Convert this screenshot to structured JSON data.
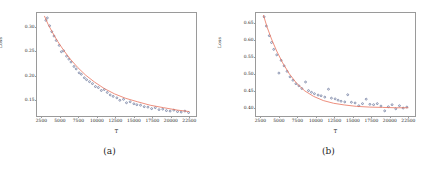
{
  "figure": {
    "width": 439,
    "height": 172,
    "background": "#ffffff"
  },
  "panels": [
    {
      "caption": "(a)",
      "chart_data": {
        "type": "scatter",
        "title": "",
        "xlabel": "T",
        "ylabel": "Loss",
        "xlim": [
          1900,
          23400
        ],
        "ylim": [
          0.118,
          0.328
        ],
        "xticks": [
          2500,
          5000,
          7500,
          10000,
          12500,
          15000,
          17500,
          20000,
          22500
        ],
        "xticklabels": [
          "2500",
          "5000",
          "7500",
          "10000",
          "12500",
          "15000",
          "17500",
          "20000",
          "22500"
        ],
        "yticks": [
          0.15,
          0.2,
          0.25,
          0.3
        ],
        "yticklabels": [
          "0.15",
          "0.20",
          "0.25",
          "0.30"
        ],
        "grid": false,
        "legend": null,
        "point_color": "#4a5a86",
        "line_color": "#e8705a",
        "series": [
          {
            "name": "observed loss",
            "type": "scatter",
            "x": [
              3100,
              3300,
              3600,
              3900,
              4200,
              4500,
              4900,
              5200,
              5500,
              5900,
              6200,
              6500,
              6900,
              7200,
              7600,
              7900,
              8300,
              8600,
              9000,
              9400,
              9800,
              10200,
              10600,
              11000,
              11400,
              11800,
              12200,
              12700,
              13100,
              13600,
              14000,
              14500,
              15000,
              15400,
              15900,
              16400,
              16900,
              17400,
              17900,
              18400,
              18900,
              19400,
              19900,
              20400,
              20900,
              21400,
              21900,
              22400
            ],
            "y": [
              0.313,
              0.318,
              0.302,
              0.29,
              0.281,
              0.272,
              0.262,
              0.249,
              0.251,
              0.24,
              0.234,
              0.228,
              0.219,
              0.214,
              0.206,
              0.203,
              0.196,
              0.192,
              0.188,
              0.184,
              0.178,
              0.176,
              0.17,
              0.172,
              0.166,
              0.161,
              0.158,
              0.155,
              0.15,
              0.152,
              0.145,
              0.147,
              0.143,
              0.141,
              0.14,
              0.137,
              0.136,
              0.133,
              0.135,
              0.131,
              0.132,
              0.129,
              0.128,
              0.13,
              0.127,
              0.126,
              0.128,
              0.125
            ]
          },
          {
            "name": "fitted curve",
            "type": "line",
            "x": [
              2900,
              3400,
              4000,
              4700,
              5500,
              6400,
              7400,
              8500,
              9700,
              11000,
              12400,
              13900,
              15500,
              17200,
              19000,
              20900,
              22500
            ],
            "y": [
              0.322,
              0.305,
              0.288,
              0.27,
              0.252,
              0.234,
              0.217,
              0.201,
              0.187,
              0.174,
              0.163,
              0.154,
              0.147,
              0.14,
              0.135,
              0.13,
              0.127
            ]
          }
        ]
      }
    },
    {
      "caption": "(b)",
      "chart_data": {
        "type": "scatter",
        "title": "",
        "xlabel": "T",
        "ylabel": "Loss",
        "xlim": [
          1900,
          23400
        ],
        "ylim": [
          0.378,
          0.678
        ],
        "xticks": [
          2500,
          5000,
          7500,
          10000,
          12500,
          15000,
          17500,
          20000,
          22500
        ],
        "xticklabels": [
          "2500",
          "5000",
          "7500",
          "10000",
          "12500",
          "15000",
          "17500",
          "20000",
          "22500"
        ],
        "yticks": [
          0.4,
          0.45,
          0.5,
          0.55,
          0.6,
          0.65
        ],
        "yticklabels": [
          "0.40",
          "0.45",
          "0.50",
          "0.55",
          "0.60",
          "0.65"
        ],
        "grid": false,
        "legend": null,
        "point_color": "#4a5a86",
        "line_color": "#e8705a",
        "series": [
          {
            "name": "observed loss",
            "type": "scatter",
            "x": [
              3000,
              3300,
              3700,
              4000,
              4300,
              4700,
              5000,
              5300,
              5700,
              6100,
              6500,
              6900,
              7300,
              7700,
              8100,
              8600,
              9000,
              9400,
              9800,
              10300,
              10700,
              11200,
              11700,
              12100,
              12600,
              13000,
              13400,
              13900,
              14300,
              14800,
              15300,
              15800,
              16300,
              16800,
              17300,
              17800,
              18300,
              18800,
              19300,
              19800,
              20300,
              20800,
              21300,
              21800,
              22300
            ],
            "y": [
              0.667,
              0.64,
              0.612,
              0.592,
              0.572,
              0.556,
              0.503,
              0.54,
              0.524,
              0.508,
              0.492,
              0.482,
              0.472,
              0.466,
              0.458,
              0.477,
              0.452,
              0.447,
              0.443,
              0.439,
              0.437,
              0.433,
              0.456,
              0.43,
              0.428,
              0.424,
              0.421,
              0.419,
              0.44,
              0.418,
              0.416,
              0.408,
              0.414,
              0.427,
              0.412,
              0.411,
              0.414,
              0.407,
              0.393,
              0.405,
              0.411,
              0.399,
              0.408,
              0.401,
              0.404
            ]
          },
          {
            "name": "fitted curve",
            "type": "line",
            "x": [
              2900,
              3400,
              4000,
              4700,
              5500,
              6400,
              7400,
              8500,
              9700,
              11000,
              12400,
              13900,
              15500,
              17200,
              19000,
              20900,
              22500
            ],
            "y": [
              0.672,
              0.637,
              0.602,
              0.567,
              0.533,
              0.501,
              0.473,
              0.451,
              0.435,
              0.423,
              0.415,
              0.41,
              0.406,
              0.404,
              0.403,
              0.402,
              0.402
            ]
          }
        ]
      }
    }
  ]
}
